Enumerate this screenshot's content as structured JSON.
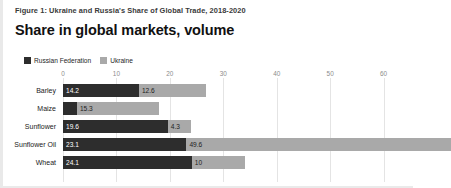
{
  "caption": "Figure 1: Ukraine and Russia's Share of Global Trade, 2018-2020",
  "title": "Share in global markets, volume",
  "legend": {
    "items": [
      {
        "label": "Russian Federation",
        "color": "#2d2d2d"
      },
      {
        "label": "Ukraine",
        "color": "#a9a9a9"
      }
    ]
  },
  "colors": {
    "russia": "#2d2d2d",
    "ukraine": "#a9a9a9",
    "gridline": "#e4e4e4",
    "tick_text": "#8c8c8c",
    "category_text": "#1a1a1a",
    "background": "#ffffff"
  },
  "chart_data": {
    "type": "bar",
    "orientation": "horizontal",
    "stacked": true,
    "title": "Share in global markets, volume",
    "subtitle": "Figure 1: Ukraine and Russia's Share of Global Trade, 2018-2020",
    "xlabel": "",
    "ylabel": "",
    "xlim": [
      0,
      65.5
    ],
    "xticks": [
      0,
      10,
      20,
      30,
      40,
      50,
      60
    ],
    "xtick_labels": [
      "0",
      "10",
      "20",
      "30",
      "40",
      "50",
      "60"
    ],
    "grid": true,
    "legend_position": "top-left",
    "categories": [
      "Barley",
      "Maize",
      "Sunflower",
      "Sunflower Oil",
      "Wheat"
    ],
    "series": [
      {
        "name": "Russian Federation",
        "color": "#2d2d2d",
        "values": [
          14.2,
          2.6,
          19.6,
          23.1,
          24.1
        ],
        "labels": [
          "14.2",
          "",
          "19.6",
          "23.1",
          "24.1"
        ]
      },
      {
        "name": "Ukraine",
        "color": "#a9a9a9",
        "values": [
          12.6,
          15.3,
          4.3,
          49.6,
          10
        ],
        "labels": [
          "12.6",
          "15.3",
          "4.3",
          "49.6",
          "10"
        ]
      }
    ]
  }
}
